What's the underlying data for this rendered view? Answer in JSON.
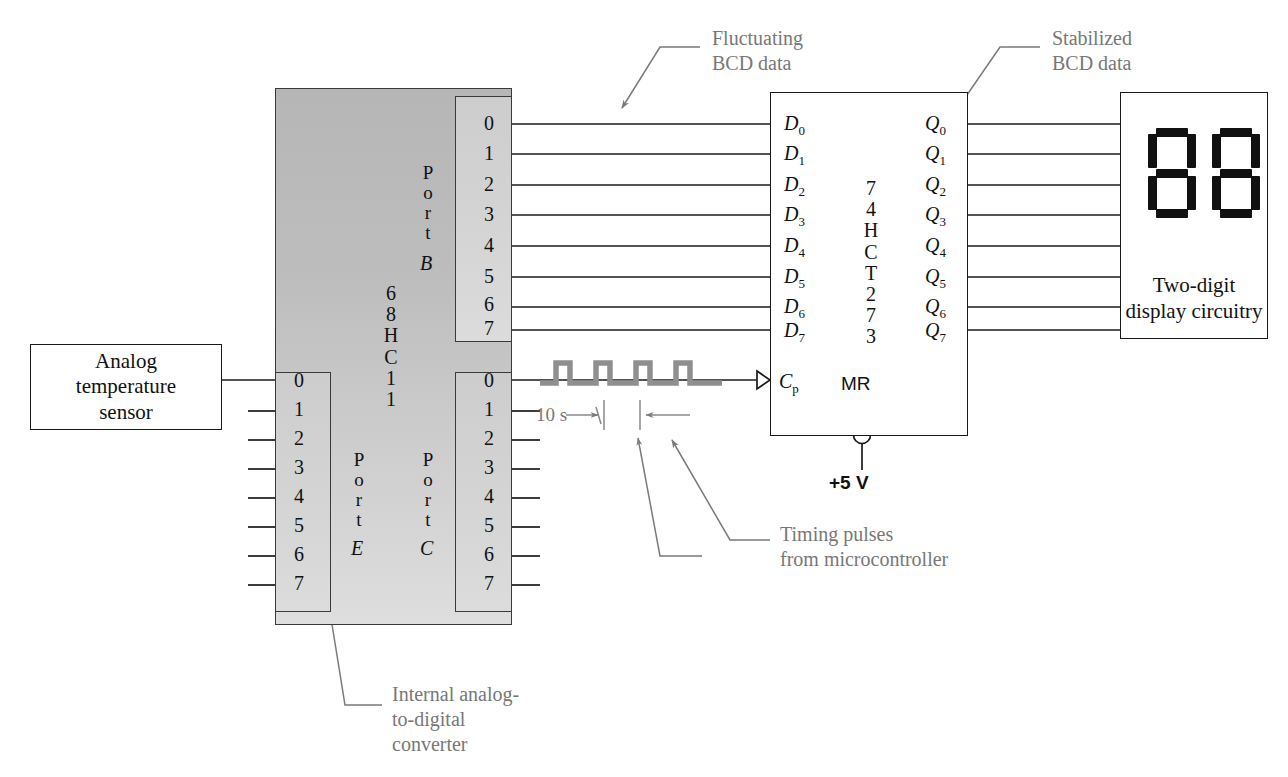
{
  "diagram": {
    "domain": "circuit-block-diagram"
  },
  "sensor_block": {
    "name": "analog-temperature-sensor",
    "line1": "Analog",
    "line2": "temperature",
    "line3": "sensor"
  },
  "mcu": {
    "name": "68HC11 microcontroller",
    "chip_label": [
      "6",
      "8",
      "H",
      "C",
      "1",
      "1"
    ],
    "ports": [
      {
        "id": "port-b",
        "word": [
          "P",
          "o",
          "r",
          "t"
        ],
        "letter": "B",
        "pins": [
          "0",
          "1",
          "2",
          "3",
          "4",
          "5",
          "6",
          "7"
        ]
      },
      {
        "id": "port-e",
        "word": [
          "P",
          "o",
          "r",
          "t"
        ],
        "letter": "E",
        "pins": [
          "0",
          "1",
          "2",
          "3",
          "4",
          "5",
          "6",
          "7"
        ]
      },
      {
        "id": "port-c",
        "word": [
          "P",
          "o",
          "r",
          "t"
        ],
        "letter": "C",
        "pins": [
          "0",
          "1",
          "2",
          "3",
          "4",
          "5",
          "6",
          "7"
        ]
      }
    ]
  },
  "latch": {
    "name": "74HCT273 octal D flip-flop",
    "chip_label": [
      "7",
      "4",
      "H",
      "C",
      "T",
      "2",
      "7",
      "3"
    ],
    "inputs": [
      "D0",
      "D1",
      "D2",
      "D3",
      "D4",
      "D5",
      "D6",
      "D7"
    ],
    "input_base": "D",
    "input_subs": [
      "0",
      "1",
      "2",
      "3",
      "4",
      "5",
      "6",
      "7"
    ],
    "outputs": [
      "Q0",
      "Q1",
      "Q2",
      "Q3",
      "Q4",
      "Q5",
      "Q6",
      "Q7"
    ],
    "output_base": "Q",
    "output_subs": [
      "0",
      "1",
      "2",
      "3",
      "4",
      "5",
      "6",
      "7"
    ],
    "clock_base": "C",
    "clock_sub": "p",
    "reset_label": "MR",
    "supply_label": "+5 V"
  },
  "display_block": {
    "name": "two-digit-display",
    "line1": "Two-digit",
    "line2": "display circuitry",
    "digits": [
      "8",
      "8"
    ]
  },
  "annotations": {
    "fluctuating": {
      "line1": "Fluctuating",
      "line2": "BCD data"
    },
    "stabilized": {
      "line1": "Stabilized",
      "line2": "BCD data"
    },
    "adc": {
      "line1": "Internal analog-",
      "line2": "to-digital",
      "line3": "converter"
    },
    "timing": {
      "line1": "Timing pulses",
      "line2": "from microcontroller"
    },
    "period": "10 s"
  },
  "colors": {
    "ink": "#111111",
    "annotation_gray": "#777777",
    "wire": "#1a1a1a",
    "chip_fill_top": "#b6b6b6",
    "chip_fill_bottom": "#dedede",
    "port_fill": "#d3d3d3",
    "waveform": "#8a8a8a"
  }
}
